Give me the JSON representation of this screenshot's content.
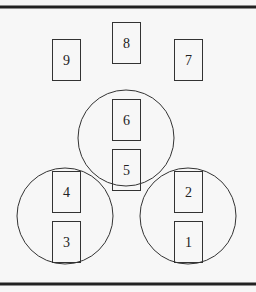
{
  "diagram": {
    "background": "#f7f7f7",
    "stroke": "#333333",
    "rules": [
      {
        "name": "top-rule",
        "y": 7
      },
      {
        "name": "bottom-rule",
        "y": 284
      }
    ],
    "circles": [
      {
        "name": "top-circle",
        "cx": 126,
        "cy": 138,
        "r": 48
      },
      {
        "name": "left-circle",
        "cx": 65,
        "cy": 216,
        "r": 48
      },
      {
        "name": "right-circle",
        "cx": 188,
        "cy": 216,
        "r": 48
      }
    ],
    "boxes": [
      {
        "label": "9",
        "x": 52,
        "y": 39,
        "w": 28,
        "h": 41
      },
      {
        "label": "8",
        "x": 112,
        "y": 22,
        "w": 28,
        "h": 41
      },
      {
        "label": "7",
        "x": 174,
        "y": 39,
        "w": 28,
        "h": 41
      },
      {
        "label": "6",
        "x": 112,
        "y": 99,
        "w": 28,
        "h": 41
      },
      {
        "label": "5",
        "x": 112,
        "y": 149,
        "w": 28,
        "h": 41
      },
      {
        "label": "4",
        "x": 52,
        "y": 171,
        "w": 28,
        "h": 41
      },
      {
        "label": "3",
        "x": 52,
        "y": 221,
        "w": 28,
        "h": 41
      },
      {
        "label": "2",
        "x": 174,
        "y": 171,
        "w": 28,
        "h": 41
      },
      {
        "label": "1",
        "x": 174,
        "y": 221,
        "w": 28,
        "h": 41
      }
    ]
  }
}
